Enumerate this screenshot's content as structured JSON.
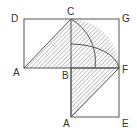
{
  "diagram": {
    "labels": {
      "D": "D",
      "C": "C",
      "G": "G",
      "A_left": "A",
      "B": "B",
      "F": "F",
      "A_bottom": "A",
      "E": "E"
    },
    "colors": {
      "stroke": "#555555",
      "hatch": "#888888",
      "background": "#ffffff"
    }
  }
}
